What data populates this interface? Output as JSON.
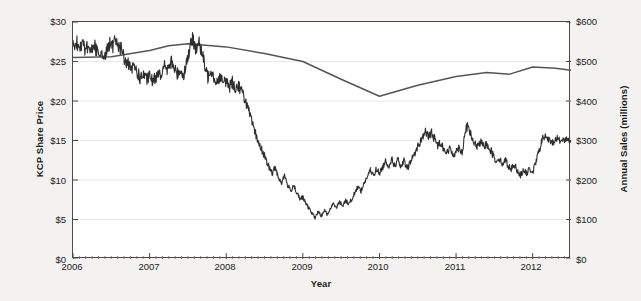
{
  "chart_data": {
    "type": "line",
    "title": "",
    "xlabel": "Year",
    "ylabel": "KCP Share Price",
    "y2label": "Annual Sales (millions)",
    "grid": true,
    "legend": "none",
    "xlim": [
      2006,
      2012.5
    ],
    "ylim": [
      0,
      30
    ],
    "y2lim": [
      0,
      600
    ],
    "xticks": [
      "2006",
      "2007",
      "2008",
      "2009",
      "2010",
      "2011",
      "2012"
    ],
    "yticks": [
      "$0",
      "$5",
      "$10",
      "$15",
      "$20",
      "$25",
      "$30"
    ],
    "y2ticks": [
      "$0",
      "$100",
      "$200",
      "$300",
      "$400",
      "$500",
      "$600"
    ],
    "series": [
      {
        "name": "KCP Share Price",
        "axis": "left",
        "color": "#2e2e2e",
        "style": "jagged-daily",
        "units": "USD per share",
        "x": [
          2006.0,
          2006.04,
          2006.08,
          2006.12,
          2006.16,
          2006.2,
          2006.24,
          2006.28,
          2006.32,
          2006.36,
          2006.4,
          2006.44,
          2006.48,
          2006.52,
          2006.56,
          2006.6,
          2006.64,
          2006.68,
          2006.72,
          2006.76,
          2006.8,
          2006.84,
          2006.88,
          2006.92,
          2006.96,
          2007.0,
          2007.04,
          2007.08,
          2007.12,
          2007.16,
          2007.2,
          2007.24,
          2007.28,
          2007.32,
          2007.36,
          2007.4,
          2007.44,
          2007.48,
          2007.52,
          2007.56,
          2007.6,
          2007.64,
          2007.68,
          2007.72,
          2007.76,
          2007.8,
          2007.84,
          2007.88,
          2007.92,
          2007.96,
          2008.0,
          2008.04,
          2008.08,
          2008.12,
          2008.16,
          2008.2,
          2008.24,
          2008.28,
          2008.32,
          2008.36,
          2008.4,
          2008.44,
          2008.48,
          2008.52,
          2008.56,
          2008.6,
          2008.64,
          2008.68,
          2008.72,
          2008.76,
          2008.8,
          2008.84,
          2008.88,
          2008.92,
          2008.96,
          2009.0,
          2009.04,
          2009.08,
          2009.12,
          2009.16,
          2009.2,
          2009.24,
          2009.28,
          2009.32,
          2009.36,
          2009.4,
          2009.44,
          2009.48,
          2009.52,
          2009.56,
          2009.6,
          2009.64,
          2009.68,
          2009.72,
          2009.76,
          2009.8,
          2009.84,
          2009.88,
          2009.92,
          2009.96,
          2010.0,
          2010.04,
          2010.08,
          2010.12,
          2010.16,
          2010.2,
          2010.24,
          2010.28,
          2010.32,
          2010.36,
          2010.4,
          2010.44,
          2010.48,
          2010.52,
          2010.56,
          2010.6,
          2010.64,
          2010.68,
          2010.72,
          2010.76,
          2010.8,
          2010.84,
          2010.88,
          2010.92,
          2010.96,
          2011.0,
          2011.04,
          2011.08,
          2011.12,
          2011.16,
          2011.2,
          2011.24,
          2011.28,
          2011.32,
          2011.36,
          2011.4,
          2011.44,
          2011.48,
          2011.52,
          2011.56,
          2011.6,
          2011.64,
          2011.68,
          2011.72,
          2011.76,
          2011.8,
          2011.84,
          2011.88,
          2011.92,
          2011.96,
          2012.0,
          2012.04,
          2012.08,
          2012.12,
          2012.16,
          2012.2,
          2012.24,
          2012.28,
          2012.32,
          2012.38,
          2012.44,
          2012.5
        ],
        "y": [
          27.0,
          27.6,
          26.8,
          27.4,
          26.6,
          27.2,
          26.4,
          27.0,
          26.2,
          26.0,
          25.6,
          26.2,
          27.4,
          26.8,
          27.8,
          27.0,
          26.4,
          25.0,
          24.6,
          23.8,
          24.4,
          23.6,
          22.8,
          23.4,
          22.6,
          23.2,
          22.4,
          23.0,
          24.0,
          23.2,
          24.6,
          23.8,
          25.0,
          24.2,
          23.4,
          24.0,
          23.2,
          24.8,
          26.4,
          27.8,
          26.8,
          27.4,
          26.2,
          24.4,
          23.0,
          24.2,
          23.0,
          22.4,
          23.2,
          22.2,
          22.6,
          21.8,
          22.4,
          21.6,
          22.0,
          21.2,
          20.4,
          19.2,
          17.8,
          16.4,
          15.4,
          14.2,
          13.6,
          12.4,
          11.6,
          10.8,
          11.6,
          10.4,
          9.6,
          10.6,
          9.4,
          8.6,
          9.4,
          8.4,
          7.6,
          7.8,
          7.0,
          6.4,
          5.8,
          5.2,
          6.0,
          5.4,
          6.2,
          5.6,
          6.4,
          7.0,
          6.6,
          7.2,
          6.8,
          7.4,
          7.0,
          7.6,
          8.4,
          9.2,
          8.6,
          9.6,
          10.4,
          11.2,
          10.6,
          11.4,
          10.8,
          11.6,
          12.4,
          11.8,
          12.6,
          11.8,
          12.6,
          11.6,
          12.4,
          11.4,
          12.2,
          13.0,
          13.8,
          14.6,
          15.4,
          16.2,
          15.4,
          16.0,
          15.2,
          14.4,
          14.8,
          14.0,
          13.4,
          14.0,
          13.2,
          13.6,
          14.2,
          13.4,
          16.4,
          16.8,
          15.4,
          14.6,
          14.2,
          14.8,
          14.2,
          14.6,
          14.0,
          13.2,
          12.4,
          12.8,
          12.0,
          12.6,
          11.8,
          11.4,
          12.0,
          11.2,
          10.6,
          11.2,
          10.8,
          11.4,
          11.0,
          12.2,
          13.6,
          15.0,
          15.6,
          15.2,
          14.6,
          15.0,
          15.2,
          15.0,
          15.2,
          15.0
        ]
      },
      {
        "name": "Annual Sales",
        "axis": "right",
        "color": "#555555",
        "style": "smooth-annual",
        "units": "millions USD",
        "x": [
          2006.0,
          2006.5,
          2007.0,
          2007.25,
          2007.5,
          2008.0,
          2008.5,
          2009.0,
          2009.5,
          2010.0,
          2010.5,
          2011.0,
          2011.4,
          2011.7,
          2012.0,
          2012.3,
          2012.5
        ],
        "y": [
          510,
          512,
          528,
          540,
          545,
          537,
          520,
          500,
          455,
          412,
          440,
          462,
          472,
          468,
          486,
          483,
          478
        ]
      }
    ]
  }
}
